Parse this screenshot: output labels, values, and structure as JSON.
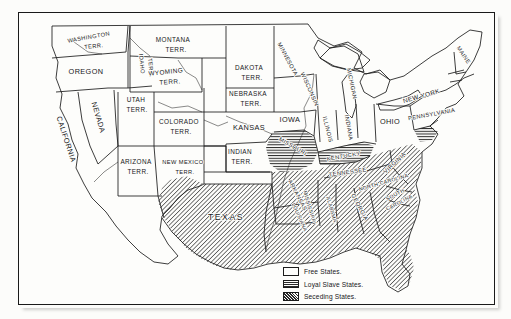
{
  "map": {
    "title": "United States — Free, Loyal Slave, and Seceding States",
    "background_color": "#fcfcfa",
    "ink_color": "#17171a",
    "legend": {
      "items": [
        {
          "label": "Free States.",
          "pattern": "blank",
          "swatch": "sw-free"
        },
        {
          "label": "Loyal Slave States.",
          "pattern": "horizontal-lines",
          "swatch": "sw-loyal"
        },
        {
          "label": "Seceding States.",
          "pattern": "diagonal-hatch",
          "swatch": "sw-sec"
        }
      ]
    },
    "regions": [
      {
        "name": "washington-territory",
        "label": "WASHINGTON\nTERR.",
        "category": "free"
      },
      {
        "name": "oregon",
        "label": "OREGON",
        "category": "free"
      },
      {
        "name": "idaho-territory",
        "label": "IDAHO\nTERR.",
        "category": "free"
      },
      {
        "name": "california",
        "label": "CALIFORNIA",
        "category": "free"
      },
      {
        "name": "nevada",
        "label": "NEVADA",
        "category": "free"
      },
      {
        "name": "montana-territory",
        "label": "MONTANA\nTERR.",
        "category": "free"
      },
      {
        "name": "dakota-territory",
        "label": "DAKOTA\nTERR.",
        "category": "free"
      },
      {
        "name": "wyoming-territory",
        "label": "WYOMING\nTERR.",
        "category": "free"
      },
      {
        "name": "utah-territory",
        "label": "UTAH\nTERR.",
        "category": "free"
      },
      {
        "name": "colorado-territory",
        "label": "COLORADO\nTERR.",
        "category": "free"
      },
      {
        "name": "nebraska-territory",
        "label": "NEBRASKA\nTERR.",
        "category": "free"
      },
      {
        "name": "kansas",
        "label": "KANSAS",
        "category": "free"
      },
      {
        "name": "arizona-territory",
        "label": "ARIZONA\nTERR.",
        "category": "free"
      },
      {
        "name": "new-mexico-territory",
        "label": "NEW MEXICO\nTERR.",
        "category": "free"
      },
      {
        "name": "indian-territory",
        "label": "INDIAN\nTERR.",
        "category": "seceding"
      },
      {
        "name": "texas",
        "label": "TEXAS",
        "category": "seceding"
      },
      {
        "name": "minnesota",
        "label": "MINNESOTA",
        "category": "free"
      },
      {
        "name": "wisconsin",
        "label": "WISCONSIN",
        "category": "free"
      },
      {
        "name": "iowa",
        "label": "IOWA",
        "category": "free"
      },
      {
        "name": "michigan",
        "label": "MICHIGAN",
        "category": "free"
      },
      {
        "name": "illinois",
        "label": "ILLINOIS",
        "category": "free"
      },
      {
        "name": "indiana",
        "label": "INDIANA",
        "category": "free"
      },
      {
        "name": "ohio",
        "label": "OHIO",
        "category": "free"
      },
      {
        "name": "missouri",
        "label": "MISSOURI",
        "category": "loyal-slave"
      },
      {
        "name": "kentucky",
        "label": "KENTUCKY",
        "category": "loyal-slave"
      },
      {
        "name": "arkansas",
        "label": "ARKANSAS",
        "category": "seceding"
      },
      {
        "name": "louisiana",
        "label": "LOUISIANA",
        "category": "seceding"
      },
      {
        "name": "tennessee",
        "label": "TENNESSEE",
        "category": "seceding"
      },
      {
        "name": "mississippi",
        "label": "MISSISSIPPI",
        "category": "seceding"
      },
      {
        "name": "alabama",
        "label": "ALABAMA",
        "category": "seceding"
      },
      {
        "name": "georgia",
        "label": "GEORGIA",
        "category": "seceding"
      },
      {
        "name": "florida",
        "label": "",
        "category": "seceding"
      },
      {
        "name": "south-carolina",
        "label": "SOUTH\nCAROLINA",
        "category": "seceding"
      },
      {
        "name": "north-carolina",
        "label": "NORTH CAROLINA",
        "category": "seceding"
      },
      {
        "name": "virginia",
        "label": "VIRGINIA",
        "category": "seceding"
      },
      {
        "name": "maryland-delaware",
        "label": "",
        "category": "loyal-slave"
      },
      {
        "name": "pennsylvania",
        "label": "PENNSYLVANIA",
        "category": "free"
      },
      {
        "name": "new-york",
        "label": "NEW YORK",
        "category": "free"
      },
      {
        "name": "maine",
        "label": "MAINE",
        "category": "free"
      },
      {
        "name": "new-england",
        "label": "",
        "category": "free"
      }
    ]
  }
}
